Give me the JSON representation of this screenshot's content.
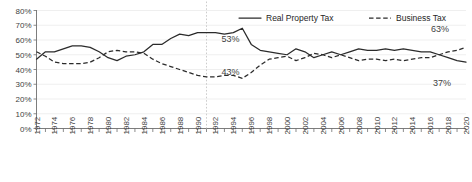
{
  "chart_data": {
    "type": "line",
    "title": "",
    "subtitle": "",
    "xlabel": "",
    "ylabel": "",
    "grid": true,
    "legend_position": "top-right",
    "xlim": [
      1972,
      2020
    ],
    "ylim": [
      0,
      80
    ],
    "ytick_labels": [
      "80%",
      "70%",
      "60%",
      "50%",
      "40%",
      "30%",
      "20%",
      "10%",
      "0%"
    ],
    "ytick_values": [
      80,
      70,
      60,
      50,
      40,
      30,
      20,
      10,
      0
    ],
    "xtick_labels": [
      "1972",
      "1974",
      "1976",
      "1978",
      "1980",
      "1982",
      "1984",
      "1986",
      "1988",
      "1990",
      "1992",
      "1994",
      "1996",
      "1998",
      "2000",
      "2002",
      "2004",
      "2006",
      "2008",
      "2010",
      "2012",
      "2014",
      "2016",
      "2018",
      "2020"
    ],
    "xtick_values": [
      1972,
      1974,
      1976,
      1978,
      1980,
      1982,
      1984,
      1986,
      1988,
      1990,
      1992,
      1994,
      1996,
      1998,
      2000,
      2002,
      2004,
      2006,
      2008,
      2010,
      2012,
      2014,
      2016,
      2018,
      2020
    ],
    "x": [
      1972,
      1973,
      1974,
      1975,
      1976,
      1977,
      1978,
      1979,
      1980,
      1981,
      1982,
      1983,
      1984,
      1985,
      1986,
      1987,
      1988,
      1989,
      1990,
      1991,
      1992,
      1993,
      1994,
      1995,
      1996,
      1997,
      1998,
      1999,
      2000,
      2001,
      2002,
      2003,
      2004,
      2005,
      2006,
      2007,
      2008,
      2009,
      2010,
      2011,
      2012,
      2013,
      2014,
      2015,
      2016,
      2017,
      2018,
      2019,
      2020
    ],
    "series": [
      {
        "name": "Real Property Tax",
        "style": "solid",
        "color": "#2b2b2b",
        "values": [
          47,
          52,
          52,
          54,
          56,
          56,
          55,
          52,
          48,
          46,
          49,
          50,
          52,
          57,
          57,
          61,
          64,
          63,
          65,
          65,
          65,
          64,
          65,
          68,
          57,
          53,
          52,
          51,
          50,
          54,
          52,
          48,
          50,
          52,
          50,
          52,
          54,
          53,
          53,
          54,
          53,
          54,
          53,
          52,
          52,
          50,
          48,
          46,
          45
        ]
      },
      {
        "name": "Business Tax",
        "style": "dashed",
        "color": "#2b2b2b",
        "values": [
          52,
          49,
          45,
          44,
          44,
          44,
          45,
          48,
          52,
          53,
          52,
          52,
          51,
          47,
          44,
          42,
          40,
          38,
          36,
          35,
          35,
          36,
          36,
          34,
          38,
          43,
          47,
          48,
          49,
          46,
          48,
          51,
          50,
          48,
          50,
          48,
          46,
          47,
          47,
          46,
          47,
          46,
          47,
          48,
          48,
          50,
          52,
          53,
          55
        ]
      }
    ],
    "annotations": [
      {
        "label": "53%",
        "x": 1992,
        "y": 57,
        "series": "Real Property Tax"
      },
      {
        "label": "43%",
        "x": 1992,
        "y": 43,
        "series": "Business Tax"
      },
      {
        "label": "63%",
        "x": 2019,
        "y": 63,
        "series": "Business Tax"
      },
      {
        "label": "37%",
        "x": 2019,
        "y": 37,
        "series": "Real Property Tax"
      }
    ],
    "marker_lines": [
      {
        "x": 1991,
        "style": "dotted",
        "color": "#c6c6c6"
      }
    ]
  },
  "legend": {
    "items": [
      {
        "label": "Real Property Tax",
        "style": "solid"
      },
      {
        "label": "Business Tax",
        "style": "dashed"
      }
    ]
  }
}
